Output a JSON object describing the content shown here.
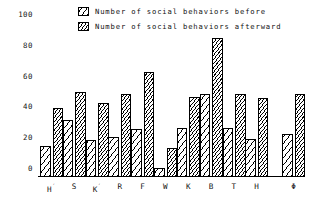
{
  "chart_data": {
    "type": "bar",
    "title": "",
    "subtitle": "",
    "xlabel": "",
    "ylabel": "",
    "ylim": [
      0,
      100
    ],
    "yticks": [
      0,
      20,
      40,
      60,
      80,
      100
    ],
    "grid": false,
    "legend_position": "top-center",
    "categories": [
      "H'",
      "S",
      "K'",
      "R",
      "F",
      "W",
      "K",
      "B",
      "T",
      "H",
      "Φ"
    ],
    "series": [
      {
        "name": "Number of social behaviors before",
        "pattern": "diagonal-hatch-wide",
        "values": [
          20,
          37,
          24,
          26,
          31,
          6,
          32,
          54,
          32,
          25,
          28
        ]
      },
      {
        "name": "Number of social behaviors afterward",
        "pattern": "diagonal-hatch-dense",
        "values": [
          45,
          55,
          48,
          54,
          68,
          19,
          52,
          90,
          54,
          51,
          54
        ]
      }
    ]
  },
  "legend": {
    "items": [
      {
        "label": "Number of social behaviors before",
        "swatch": "hatch-before-swatch"
      },
      {
        "label": "Number of social behaviors afterward",
        "swatch": "hatch-after-swatch"
      }
    ]
  },
  "axes": {
    "y_tick_labels": [
      "0",
      "20",
      "40",
      "60",
      "80",
      "100"
    ],
    "x_tick_labels": [
      "H'",
      "S",
      "K'",
      "R",
      "F",
      "W",
      "K",
      "B",
      "T",
      "H",
      "Φ"
    ]
  },
  "colors": {
    "ink": "#000000",
    "background": "#ffffff",
    "text": "#111111"
  }
}
